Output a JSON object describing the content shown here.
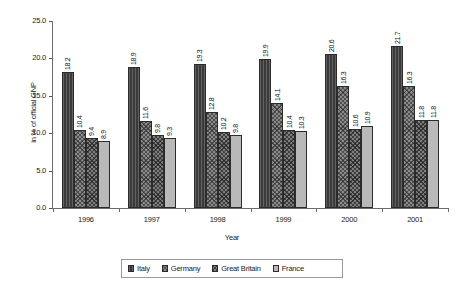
{
  "chart_data": {
    "type": "bar",
    "title": "",
    "xlabel": "Year",
    "ylabel": "in % of official GNP",
    "categories": [
      "1996",
      "1997",
      "1998",
      "1999",
      "2000",
      "2001"
    ],
    "ylim": [
      0.0,
      25.0
    ],
    "ytick_labels": [
      "0.0",
      "5.0",
      "10.0",
      "15.0",
      "20.0",
      "25.0"
    ],
    "ytick_values": [
      0.0,
      5.0,
      10.0,
      15.0,
      20.0,
      25.0
    ],
    "grid": false,
    "legend_position": "bottom",
    "series": [
      {
        "name": "Italy",
        "color": "#3b3b3b",
        "pattern": "vertical-lines",
        "values": [
          18.2,
          18.9,
          19.3,
          19.9,
          20.6,
          21.7
        ],
        "labels": [
          "18.2",
          "18.9",
          "19.3",
          "19.9",
          "20.6",
          "21.7"
        ]
      },
      {
        "name": "Germany",
        "color": "#8a8a8a",
        "pattern": "crosshatch",
        "values": [
          10.4,
          11.6,
          12.8,
          14.1,
          16.3,
          16.3
        ],
        "labels": [
          "10.4",
          "11.6",
          "12.8",
          "14.1",
          "16.3",
          "16.3"
        ]
      },
      {
        "name": "Great Britain",
        "color": "#7e7e7e",
        "pattern": "crosshatch-dense",
        "values": [
          9.4,
          9.8,
          10.2,
          10.4,
          10.6,
          11.8
        ],
        "labels": [
          "9.4",
          "9.8",
          "10.2",
          "10.4",
          "10.6",
          "11.8"
        ]
      },
      {
        "name": "France",
        "color": "#b9b9b9",
        "pattern": "solid",
        "values": [
          8.9,
          9.3,
          9.8,
          10.3,
          10.9,
          11.8
        ],
        "labels": [
          "8.9",
          "9.3",
          "9.8",
          "10.3",
          "10.9",
          "11.8"
        ]
      }
    ]
  },
  "legend": {
    "entries": [
      {
        "label": "Italy"
      },
      {
        "label": "Germany"
      },
      {
        "label": "Great Britain"
      },
      {
        "label": "France"
      }
    ]
  }
}
